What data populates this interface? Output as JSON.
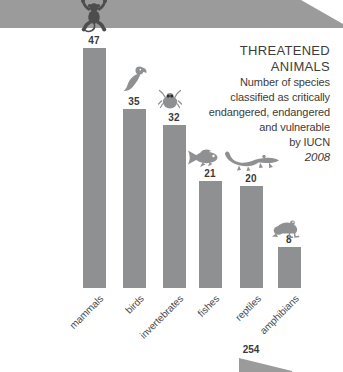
{
  "title_block": {
    "line1": "THREATENED",
    "line2": "ANIMALS",
    "subtitle_lines": [
      "Number of species",
      "classified as critically",
      "endangered, endangered",
      "and vulnerable",
      "by IUCN"
    ],
    "year": "2008"
  },
  "chart_data": {
    "type": "bar",
    "title": "THREATENED ANIMALS",
    "subtitle": "Number of species classified as critically endangered, endangered and vulnerable by IUCN 2008",
    "categories": [
      "mammals",
      "birds",
      "invertebrates",
      "fishes",
      "reptiles",
      "amphibians"
    ],
    "values": [
      47,
      35,
      32,
      21,
      20,
      8
    ],
    "icons": [
      "monkey-icon",
      "bird-icon",
      "bug-icon",
      "fish-icon",
      "crocodile-icon",
      "frog-icon"
    ],
    "ylim": [
      0,
      47
    ],
    "grid": false,
    "legend": "none",
    "value_labels_shown": true
  },
  "partial_next_chart": {
    "value": "254"
  },
  "colors": {
    "band": "#9b9b9b",
    "bar": "#8f9092",
    "icon": "#8f9092",
    "icon_dark": "#4d4d4d",
    "value_text": "#3a3a3a",
    "title_text": "#3e3b38",
    "category_text": "#4b4b4b"
  }
}
